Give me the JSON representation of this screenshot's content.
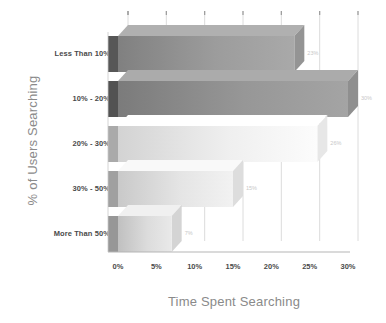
{
  "chart_data": {
    "type": "bar",
    "orientation": "horizontal",
    "title": "",
    "xlabel": "Time Spent Searching",
    "ylabel": "% of Users Searching",
    "categories": [
      "Less Than 10%",
      "10% - 20%",
      "20% - 30%",
      "30% - 50%",
      "More Than 50%"
    ],
    "values": [
      23,
      30,
      26,
      15,
      7
    ],
    "value_labels": [
      "23%",
      "30%",
      "26%",
      "15%",
      "7%"
    ],
    "xlim": [
      0,
      30
    ],
    "xticks": [
      0,
      5,
      10,
      15,
      20,
      25,
      30
    ],
    "xtick_labels": [
      "0%",
      "5%",
      "10%",
      "15%",
      "20%",
      "25%",
      "30%"
    ],
    "grid": true,
    "grid_axis": "x",
    "legend": null,
    "style": "3d-isometric",
    "bar_colors": [
      "#8f8f8f",
      "#8a8a8a",
      "#e2e2e2",
      "#d8d8d8",
      "#cfcfcf"
    ],
    "axis_color": "#bdbdbd",
    "label_color": "#8a8a8a",
    "value_label_color": "#c8c8c8"
  }
}
